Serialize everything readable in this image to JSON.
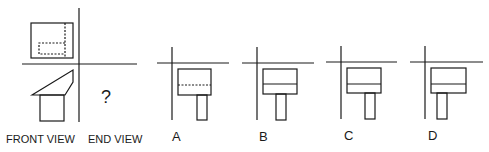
{
  "question": {
    "front_view_label": "FRONT VIEW",
    "end_view_label": "END VIEW",
    "unknown_marker": "?"
  },
  "options": [
    {
      "label": "A",
      "divider_style": "dashed"
    },
    {
      "label": "B",
      "divider_style": "solid"
    },
    {
      "label": "C",
      "divider_style": "solid"
    },
    {
      "label": "D",
      "divider_style": "solid"
    }
  ],
  "colors": {
    "stroke": "#1a1a1a",
    "background": "#ffffff"
  }
}
